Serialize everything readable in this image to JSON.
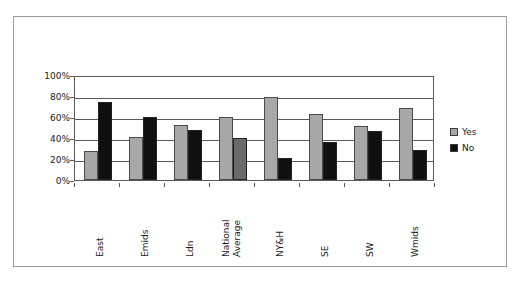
{
  "chart_data": {
    "type": "bar",
    "title": "",
    "subtitle": "",
    "xlabel": "",
    "ylabel": "",
    "ylim": [
      0,
      100
    ],
    "ytick_labels": [
      "100%",
      "80%",
      "60%",
      "40%",
      "20%",
      "0%"
    ],
    "ytick_values": [
      100,
      80,
      60,
      40,
      20,
      0
    ],
    "grid": true,
    "legend_position": "right",
    "categories": [
      "East",
      "Emids",
      "Ldn",
      "National Average",
      "NY&H",
      "SE",
      "SW",
      "Wmids"
    ],
    "category_lines": [
      [
        "East"
      ],
      [
        "Emids"
      ],
      [
        "Ldn"
      ],
      [
        "National",
        "Average"
      ],
      [
        "NY&H"
      ],
      [
        "SE"
      ],
      [
        "SW"
      ],
      [
        "Wmids"
      ]
    ],
    "series": [
      {
        "name": "Yes",
        "color": "#a8a8a8",
        "values": [
          28,
          41,
          52,
          60,
          79,
          63,
          51,
          69
        ]
      },
      {
        "name": "No",
        "color": "#101010",
        "values": [
          74,
          60,
          48,
          40,
          21,
          36,
          47,
          29
        ],
        "point_colors": [
          "#101010",
          "#101010",
          "#101010",
          "#6a6a6a",
          "#101010",
          "#101010",
          "#101010",
          "#101010"
        ]
      }
    ],
    "legend": [
      {
        "label": "Yes",
        "color": "#a8a8a8"
      },
      {
        "label": "No",
        "color": "#101010"
      }
    ],
    "colors": {
      "yes": "#a8a8a8",
      "no": "#101010",
      "national_average_no": "#6a6a6a",
      "axis": "#5a5a5a",
      "frame": "#9a9a9a",
      "text": "#1a1a1a",
      "background": "#ffffff"
    }
  }
}
